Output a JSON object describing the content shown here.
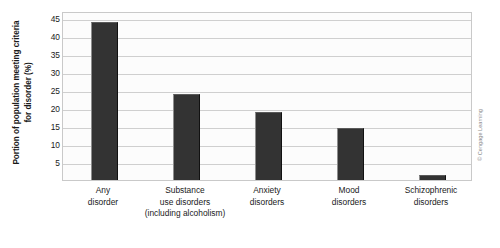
{
  "chart_data": {
    "type": "bar",
    "title": "",
    "xlabel": "",
    "ylabel": "Portion of population meeting criteria for disorder (%)",
    "ylabel_lines": [
      "Portion of population meeting criteria",
      "for disorder (%)"
    ],
    "categories": [
      "Any disorder",
      "Substance use disorders (including alcoholism)",
      "Anxiety disorders",
      "Mood disorders",
      "Schizophrenic disorders"
    ],
    "category_lines": [
      [
        "Any",
        "disorder"
      ],
      [
        "Substance",
        "use disorders",
        "(including alcoholism)"
      ],
      [
        "Anxiety",
        "disorders"
      ],
      [
        "Mood",
        "disorders"
      ],
      [
        "Schizophrenic",
        "disorders"
      ]
    ],
    "values": [
      44,
      23.8,
      19,
      14.5,
      1.5
    ],
    "ylim": [
      0,
      47
    ],
    "yticks": [
      5,
      10,
      15,
      20,
      25,
      30,
      35,
      40,
      45
    ],
    "ytick_labels": [
      "5",
      "10",
      "15",
      "20",
      "25",
      "30",
      "35",
      "40",
      "45"
    ],
    "grid": true,
    "legend": "none",
    "bar_color": "#333333",
    "plot_background": "#fcfcfc",
    "gridline_color": "#cfcfcf",
    "axis_color": "#c9c9c9"
  },
  "credit": {
    "text": "© Cengage Learning"
  }
}
